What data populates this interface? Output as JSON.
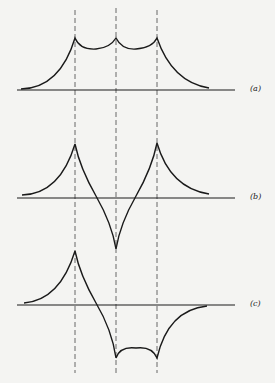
{
  "figure": {
    "panels": [
      {
        "id": "a",
        "label": "(a)",
        "description": "Three positive cusps at dashed lines, curves decaying to baseline on both ends"
      },
      {
        "id": "b",
        "label": "(b)",
        "description": "Positive cusps at outer lines, negative cusp at center line"
      },
      {
        "id": "c",
        "label": "(c)",
        "description": "Positive cusp at left line, negative cusps at center and right lines"
      }
    ],
    "dashed_lines_x": [
      75,
      116,
      157
    ],
    "colors": {
      "stroke": "#1a1a1a",
      "background": "#f4f4f2"
    }
  }
}
